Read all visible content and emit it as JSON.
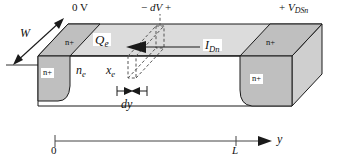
{
  "figure": {
    "type": "device-cross-section-3d"
  },
  "labels": {
    "gate_left_voltage": "0 V",
    "incremental_voltage_minus": "−",
    "incremental_voltage_var": "dV",
    "incremental_voltage_plus": "+",
    "drain_voltage_sign": "+",
    "drain_voltage_var": "V",
    "drain_voltage_sub": "DSn",
    "width_label": "W",
    "sheet_charge_var": "Q",
    "sheet_charge_sub": "e",
    "electron_density_var": "n",
    "electron_density_sub": "e",
    "channel_thickness_var": "x",
    "channel_thickness_sub": "e",
    "current_var": "I",
    "current_sub": "Dn",
    "slab_width_label": "dy",
    "region_nplus": "n+",
    "axis_origin": "0",
    "axis_length": "L",
    "axis_variable": "y"
  },
  "regions": [
    {
      "name": "source-top-nplus",
      "label": "n+"
    },
    {
      "name": "source-front-nplus",
      "label": "n+"
    },
    {
      "name": "drain-top-nplus",
      "label": "n+"
    },
    {
      "name": "drain-front-nplus",
      "label": "n+"
    }
  ],
  "axis": {
    "variable": "y",
    "ticks": [
      {
        "label": "0",
        "position": "left"
      },
      {
        "label": "L",
        "position": "right"
      }
    ]
  },
  "colors": {
    "stroke": "#1a1a1a",
    "top_face_fill": "#d9d9d9",
    "nplus_fill": "#bdbdbd",
    "end_face_fill": "#cfcfcf",
    "front_face_fill": "#ffffff",
    "shadow_fill": "#eaeaea",
    "background": "#ffffff",
    "text": "#111111"
  }
}
